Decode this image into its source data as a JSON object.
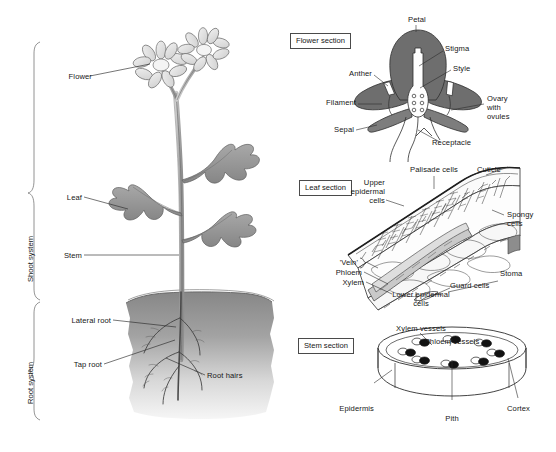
{
  "figure": {
    "background": "#ffffff",
    "panels": [
      "whole-plant",
      "flower-section",
      "leaf-section",
      "stem-section"
    ]
  },
  "colors": {
    "ink": "#161616",
    "outline": "#6b6b6b",
    "flower_petal": "#e4e4e4",
    "leaf_fill": "#9a9a9a",
    "stem_fill": "#b4b4b4",
    "soil_top": "#8d8d8d",
    "soil_bottom": "#f2f2f2",
    "flower_section_fill": "#6e6e6e",
    "bundle_dark": "#111111",
    "bundle_light": "#ffffff"
  },
  "whole_plant": {
    "brackets": [
      {
        "name": "shoot-system",
        "label": "Shoot system"
      },
      {
        "name": "root-system",
        "label": "Root system"
      }
    ],
    "labels": [
      {
        "name": "flower",
        "text": "Flower"
      },
      {
        "name": "leaf",
        "text": "Leaf"
      },
      {
        "name": "stem",
        "text": "Stem"
      },
      {
        "name": "lateral-root",
        "text": "Lateral root"
      },
      {
        "name": "tap-root",
        "text": "Tap root"
      },
      {
        "name": "root-hairs",
        "text": "Root hairs"
      }
    ]
  },
  "flower_section": {
    "title": "Flower section",
    "labels": [
      {
        "name": "petal",
        "text": "Petal"
      },
      {
        "name": "stigma",
        "text": "Stigma"
      },
      {
        "name": "style",
        "text": "Style"
      },
      {
        "name": "anther",
        "text": "Anther"
      },
      {
        "name": "filament",
        "text": "Filament"
      },
      {
        "name": "sepal",
        "text": "Sepal"
      },
      {
        "name": "ovary",
        "text": "Ovary\nwith\novules"
      },
      {
        "name": "receptacle",
        "text": "Receptacle"
      }
    ]
  },
  "leaf_section": {
    "title": "Leaf section",
    "labels": [
      {
        "name": "palisade-cells",
        "text": "Palisade cells"
      },
      {
        "name": "cuticle",
        "text": "Cuticle"
      },
      {
        "name": "upper-epidermal-cells",
        "text": "Upper\nepidermal\ncells"
      },
      {
        "name": "spongy-cells",
        "text": "Spongy\ncells"
      },
      {
        "name": "vein",
        "text": "'Vein'"
      },
      {
        "name": "phloem",
        "text": "Phloem"
      },
      {
        "name": "xylem",
        "text": "Xylem"
      },
      {
        "name": "lower-epidermal-cells",
        "text": "Lower epidermal\ncells"
      },
      {
        "name": "guard-cells",
        "text": "Guard cells"
      },
      {
        "name": "stoma",
        "text": "Stoma"
      }
    ]
  },
  "stem_section": {
    "title": "Stem section",
    "labels": [
      {
        "name": "xylem-vessels",
        "text": "Xylem vessels"
      },
      {
        "name": "phloem-vessels",
        "text": "Phloem vessels"
      },
      {
        "name": "epidermis",
        "text": "Epidermis"
      },
      {
        "name": "pith",
        "text": "Pith"
      },
      {
        "name": "cortex",
        "text": "Cortex"
      }
    ],
    "vascular_bundle_count": 8
  }
}
